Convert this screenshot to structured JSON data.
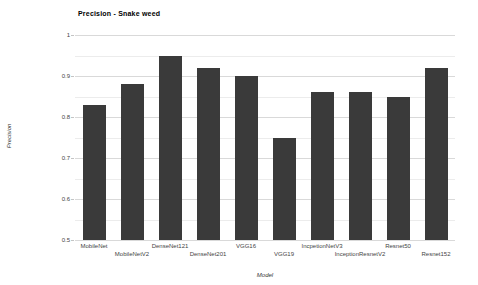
{
  "chart_data": {
    "type": "bar",
    "title": "Precision - Snake weed",
    "xlabel": "Model",
    "ylabel": "Precision",
    "categories": [
      "MobileNet",
      "MobileNetV2",
      "DenseNet121",
      "DenseNet201",
      "VGG16",
      "VGG19",
      "IncpetionNetV3",
      "InceptionResnetV2",
      "Resnet50",
      "Resnet152"
    ],
    "values": [
      0.83,
      0.88,
      0.95,
      0.92,
      0.9,
      0.75,
      0.86,
      0.86,
      0.85,
      0.92
    ],
    "ylim": [
      0.5,
      1.0
    ],
    "ytick_labels": [
      "1",
      "0.9",
      "0.8",
      "0.7",
      "0.6",
      "0.5"
    ],
    "ytick_values": [
      1.0,
      0.9,
      0.8,
      0.7,
      0.6,
      0.5
    ],
    "minor_grid_step": 0.05,
    "major_grid_step": 0.1,
    "grid": "horizontal",
    "legend": "none",
    "bar_color": "#3a3a3a",
    "major_grid_color": "#d9d9d9",
    "minor_grid_color": "#ececec",
    "x_labels_staggered": true
  }
}
